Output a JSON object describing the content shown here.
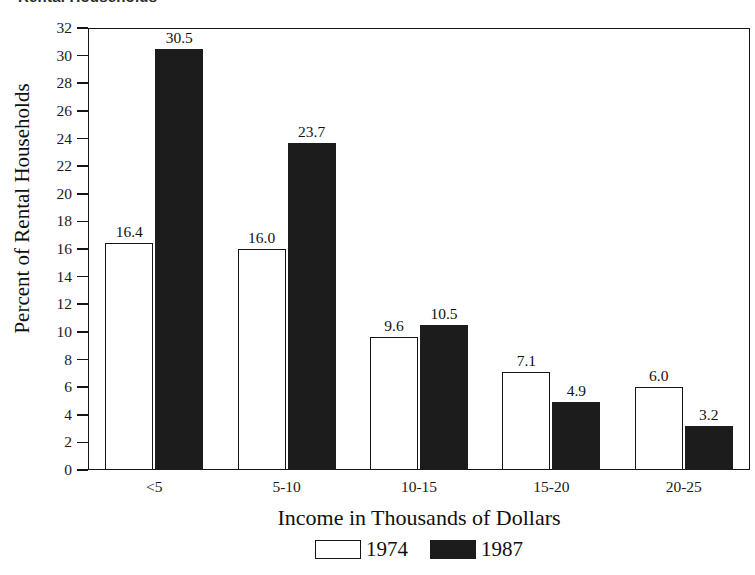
{
  "top_title": "Rental Households",
  "chart_data": {
    "type": "bar",
    "title": "Rental Households",
    "xlabel": "Income in Thousands of Dollars",
    "ylabel": "Percent of Rental Households",
    "categories": [
      "<5",
      "5-10",
      "10-15",
      "15-20",
      "20-25"
    ],
    "series": [
      {
        "name": "1974",
        "color": "#ffffff",
        "values": [
          16.4,
          16.0,
          9.6,
          7.1,
          6.0
        ]
      },
      {
        "name": "1987",
        "color": "#1c1c1c",
        "values": [
          30.5,
          23.7,
          10.5,
          4.9,
          3.2
        ]
      }
    ],
    "value_labels": {
      "1974": [
        "16.4",
        "16.0",
        "9.6",
        "7.1",
        "6.0"
      ],
      "1987": [
        "30.5",
        "23.7",
        "10.5",
        "4.9",
        "3.2"
      ]
    },
    "ylim": [
      0,
      32
    ],
    "ytick_step": 2,
    "yticks": [
      "0",
      "2",
      "4",
      "6",
      "8",
      "10",
      "12",
      "14",
      "16",
      "18",
      "20",
      "22",
      "24",
      "26",
      "28",
      "30",
      "32"
    ],
    "grid": false,
    "legend_position": "bottom-center",
    "legend_entries": [
      "1974",
      "1987"
    ]
  }
}
